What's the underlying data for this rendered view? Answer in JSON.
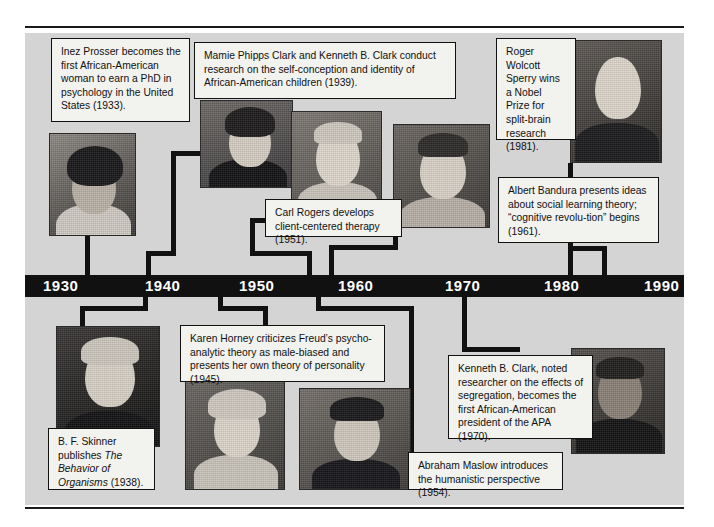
{
  "figure": {
    "type": "timeline",
    "orientation": "horizontal",
    "axis_label": "Years",
    "background_color": "#d4d4d4",
    "bar_color": "#111111",
    "bar_text_color": "#ffffff",
    "box_fill": "#f2f2ee",
    "box_border": "#111111"
  },
  "axis": {
    "ticks": [
      "1930",
      "1940",
      "1950",
      "1960",
      "1970",
      "1980",
      "1990"
    ],
    "range_start": "1930",
    "range_end": "1990",
    "step": "10"
  },
  "events_above": [
    {
      "id": "inez-prosser",
      "year": "1933",
      "person": "Inez Prosser",
      "text": "Inez Prosser becomes the first African-American woman to earn a PhD in psychology in the United States (1933)."
    },
    {
      "id": "clark-clark",
      "year": "1939",
      "person": "Mamie Phipps Clark and Kenneth B. Clark",
      "text": "Mamie Phipps Clark and Kenneth B. Clark conduct research on the self-conception and identity of African-American children (1939)."
    },
    {
      "id": "carl-rogers",
      "year": "1951",
      "person": "Carl Rogers",
      "text": "Carl Rogers develops client-centered therapy (1951)."
    },
    {
      "id": "albert-bandura",
      "year": "1961",
      "person": "Albert Bandura",
      "text": "Albert Bandura presents ideas about social learning theory; “cognitive revolu-tion” begins  (1961)."
    },
    {
      "id": "roger-sperry",
      "year": "1981",
      "person": "Roger Wolcott Sperry",
      "text": "Roger Wolcott Sperry wins a Nobel Prize for split-brain research (1981)."
    }
  ],
  "events_below": [
    {
      "id": "bf-skinner",
      "year": "1938",
      "person": "B. F. Skinner",
      "text_part1": "B. F. Skinner publishes ",
      "text_italic": "The Behavior of Organisms",
      "text_part2": " (1938)."
    },
    {
      "id": "karen-horney",
      "year": "1945",
      "person": "Karen Horney",
      "text": "Karen Horney criticizes Freud’s psycho-analytic theory as male-biased and presents her own theory of personality (1945)."
    },
    {
      "id": "abraham-maslow",
      "year": "1954",
      "person": "Abraham Maslow",
      "text": "Abraham Maslow introduces the humanistic perspective (1954)."
    },
    {
      "id": "kenneth-clark",
      "year": "1970",
      "person": "Kenneth B. Clark",
      "text": "Kenneth B. Clark, noted researcher on the effects of segregation, becomes the first African-American president of the APA (1970)."
    }
  ]
}
